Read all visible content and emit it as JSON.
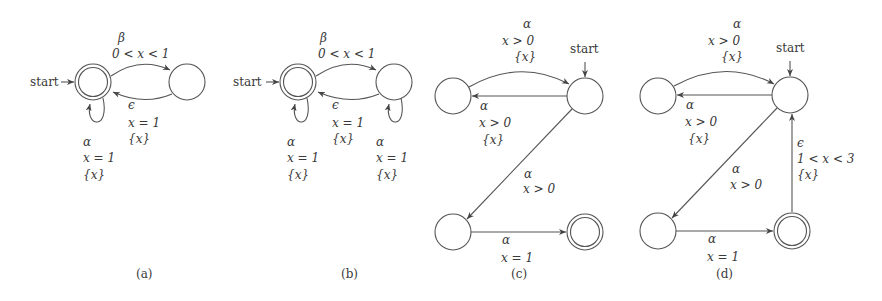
{
  "diagrams": [
    {
      "caption": "(a)",
      "start_label": "start",
      "edges": [
        {
          "from": "q0",
          "to": "q1",
          "action": "β",
          "guard": "0 < x < 1",
          "reset": ""
        },
        {
          "from": "q1",
          "to": "q0",
          "action": "ϵ",
          "guard": "x = 1",
          "reset": "{x}"
        },
        {
          "from": "q0",
          "to": "q0",
          "action": "α",
          "guard": "x = 1",
          "reset": "{x}"
        }
      ]
    },
    {
      "caption": "(b)",
      "start_label": "start",
      "edges": [
        {
          "from": "q0",
          "to": "q1",
          "action": "β",
          "guard": "0 < x < 1",
          "reset": ""
        },
        {
          "from": "q1",
          "to": "q0",
          "action": "ϵ",
          "guard": "x = 1",
          "reset": "{x}"
        },
        {
          "from": "q0",
          "to": "q0",
          "action": "α",
          "guard": "x = 1",
          "reset": "{x}"
        },
        {
          "from": "q1",
          "to": "q1",
          "action": "α",
          "guard": "x = 1",
          "reset": "{x}"
        }
      ]
    },
    {
      "caption": "(c)",
      "start_label": "start",
      "edges": [
        {
          "from": "q1",
          "to": "q0",
          "action": "α",
          "guard": "x > 0",
          "reset": "{x}"
        },
        {
          "from": "q0",
          "to": "q1",
          "action": "α",
          "guard": "x > 0",
          "reset": "{x}"
        },
        {
          "from": "q0",
          "to": "q2",
          "action": "α",
          "guard": "x > 0",
          "reset": ""
        },
        {
          "from": "q2",
          "to": "q3",
          "action": "α",
          "guard": "x = 1",
          "reset": ""
        }
      ]
    },
    {
      "caption": "(d)",
      "start_label": "start",
      "edges": [
        {
          "from": "q1",
          "to": "q0",
          "action": "α",
          "guard": "x > 0",
          "reset": "{x}"
        },
        {
          "from": "q0",
          "to": "q1",
          "action": "α",
          "guard": "x > 0",
          "reset": "{x}"
        },
        {
          "from": "q0",
          "to": "q2",
          "action": "α",
          "guard": "x > 0",
          "reset": ""
        },
        {
          "from": "q2",
          "to": "q3",
          "action": "α",
          "guard": "x = 1",
          "reset": ""
        },
        {
          "from": "q3",
          "to": "q0",
          "action": "ϵ",
          "guard": "1 < x < 3",
          "reset": "{x}"
        }
      ]
    }
  ]
}
